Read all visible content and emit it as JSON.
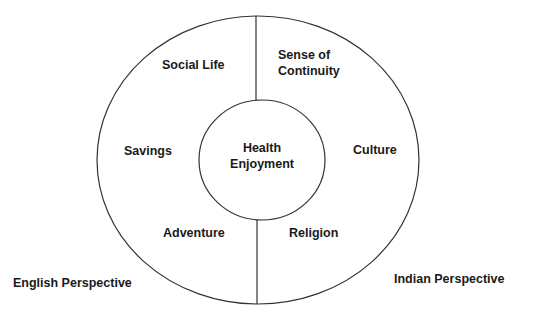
{
  "diagram": {
    "center": [
      "Health",
      "Enjoyment"
    ],
    "left_segments": {
      "top": "Social Life",
      "middle": "Savings",
      "bottom": "Adventure"
    },
    "right_segments": {
      "top": [
        "Sense of",
        "Continuity"
      ],
      "middle": "Culture",
      "bottom": "Religion"
    },
    "captions": {
      "left": "English Perspective",
      "right": "Indian Perspective"
    },
    "colors": {
      "stroke": "#333333",
      "text": "#1a1a1a",
      "background": "#ffffff"
    }
  }
}
